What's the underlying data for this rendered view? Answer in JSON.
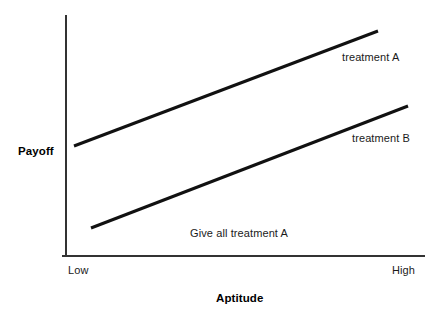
{
  "chart_data": {
    "type": "line",
    "title": "",
    "subtitle": "",
    "xlabel": "Aptitude",
    "ylabel": "Payoff",
    "xtick_labels": [
      "Low",
      "High"
    ],
    "ytick_labels": [],
    "grid": false,
    "legend_position": "inline-right",
    "xlim": [
      "Low",
      "High"
    ],
    "ylim": [
      0,
      1
    ],
    "series": [
      {
        "name": "treatment A",
        "label": "treatment A",
        "color": "#111111",
        "x": [
          "Low",
          "High"
        ],
        "values": [
          0.455,
          0.935
        ],
        "points_px": [
          [
            74,
            146
          ],
          [
            378,
            31
          ]
        ],
        "line_width": 3
      },
      {
        "name": "treatment B",
        "label": "treatment B",
        "color": "#111111",
        "x": [
          "Low",
          "High"
        ],
        "values": [
          0.115,
          0.625
        ],
        "points_px": [
          [
            91,
            228
          ],
          [
            408,
            106
          ]
        ],
        "line_width": 3
      }
    ],
    "annotations": [
      {
        "name": "give-all-treatment-a",
        "text": "Give all treatment A",
        "x_px": 190,
        "y_px": 228
      }
    ],
    "axes": {
      "y_axis_px": {
        "x": 66,
        "y_top": 15,
        "y_bottom": 256
      },
      "x_axis_px": {
        "y": 256,
        "x_left": 62,
        "x_right": 425
      },
      "color": "#333333",
      "line_width": 2
    }
  },
  "labels": {
    "y_axis_title": "Payoff",
    "x_axis_title": "Aptitude",
    "tick_low": "Low",
    "tick_high": "High",
    "series_a": "treatment A",
    "series_b": "treatment B",
    "annotation": "Give all treatment A"
  },
  "colors": {
    "background": "#ffffff",
    "line": "#111111",
    "axis": "#333333",
    "text": "#1a1a1a"
  }
}
